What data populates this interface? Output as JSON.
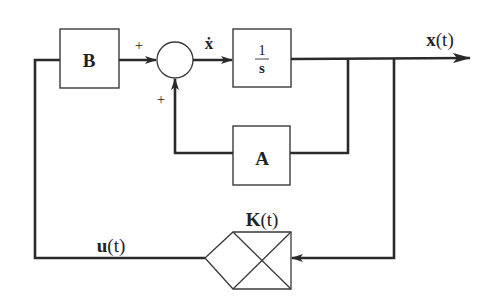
{
  "diagram": {
    "type": "state-feedback block diagram",
    "blocks": {
      "input_matrix": {
        "label": "B"
      },
      "integrator": {
        "numerator": "1",
        "denominator": "s"
      },
      "system_matrix": {
        "label": "A"
      },
      "gain": {
        "label_main": "K",
        "label_arg": "(t)"
      }
    },
    "summing_junction": {
      "input_sign_left": "+",
      "input_sign_bottom": "+"
    },
    "signals": {
      "state_derivative": "ẋ",
      "output_main": "x",
      "output_arg": "(t)",
      "control_main": "u",
      "control_arg": "(t)"
    },
    "colors": {
      "line": "#2a2a2a",
      "background": "#ffffff"
    }
  }
}
